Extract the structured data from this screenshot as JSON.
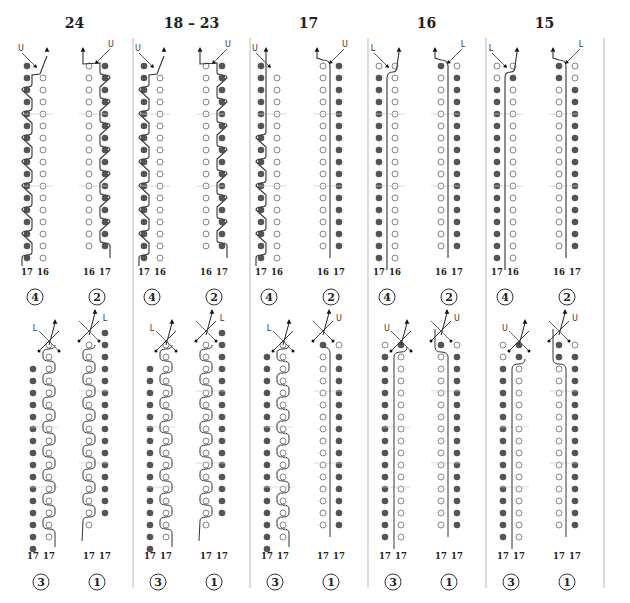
{
  "panels": [
    {
      "title": "24",
      "top": {
        "left_label": "4",
        "right_label": "2",
        "left_nums": [
          "17",
          "16"
        ],
        "right_nums": [
          "16",
          "17"
        ],
        "left_marker": "U",
        "right_marker": "U"
      },
      "bottom": {
        "left_label": "3",
        "right_label": "1",
        "left_nums": [
          "17",
          "17"
        ],
        "right_nums": [
          "17",
          "17"
        ],
        "left_marker": "L",
        "right_marker": "L"
      }
    },
    {
      "title": "18 – 23",
      "top": {
        "left_label": "4",
        "right_label": "2",
        "left_nums": [
          "17",
          "16"
        ],
        "right_nums": [
          "16",
          "17"
        ],
        "left_marker": "U",
        "right_marker": "U"
      },
      "bottom": {
        "left_label": "3",
        "right_label": "1",
        "left_nums": [
          "17",
          "17"
        ],
        "right_nums": [
          "17",
          "17"
        ],
        "left_marker": "L",
        "right_marker": "L"
      }
    },
    {
      "title": "17",
      "top": {
        "left_label": "4",
        "right_label": "2",
        "left_nums": [
          "17",
          "16"
        ],
        "right_nums": [
          "16",
          "17"
        ],
        "left_marker": "U",
        "right_marker": "U"
      },
      "bottom": {
        "left_label": "3",
        "right_label": "1",
        "left_nums": [
          "17",
          "17"
        ],
        "right_nums": [
          "17",
          "17"
        ],
        "left_marker": "L",
        "right_marker": "U"
      }
    },
    {
      "title": "16",
      "top": {
        "left_label": "4",
        "right_label": "2",
        "left_nums": [
          "17",
          "16"
        ],
        "right_nums": [
          "16",
          "17"
        ],
        "left_marker": "L",
        "right_marker": "L"
      },
      "bottom": {
        "left_label": "3",
        "right_label": "1",
        "left_nums": [
          "17",
          "17"
        ],
        "right_nums": [
          "17",
          "17"
        ],
        "left_marker": "U",
        "right_marker": "U"
      }
    },
    {
      "title": "15",
      "top": {
        "left_label": "4",
        "right_label": "2",
        "left_nums": [
          "17",
          "16"
        ],
        "right_nums": [
          "16",
          "17"
        ],
        "left_marker": "L",
        "right_marker": "L"
      },
      "bottom": {
        "left_label": "3",
        "right_label": "1",
        "left_nums": [
          "17",
          "17"
        ],
        "right_nums": [
          "17",
          "17"
        ],
        "left_marker": "U",
        "right_marker": "U"
      }
    }
  ],
  "colors": {
    "filled": "#555555",
    "line": "#333333",
    "divider": "#bbbbbb"
  }
}
